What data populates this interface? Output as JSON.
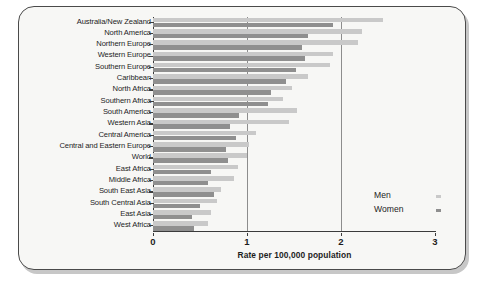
{
  "chart_data": {
    "type": "bar",
    "orientation": "horizontal",
    "title": "",
    "subtitle": "",
    "xlabel": "Rate per 100,000 population",
    "ylabel": "",
    "xlim": [
      0,
      3
    ],
    "xticks": [
      0,
      1,
      2,
      3
    ],
    "xtick_labels": [
      "0",
      "1",
      "2",
      "3"
    ],
    "grid": "vertical gridlines at x = 1 and x = 2",
    "legend_position": "inside lower right",
    "categories": [
      "Australia/New Zealand",
      "North America",
      "Northern Europe",
      "Western Europe",
      "Southern Europe",
      "Caribbean",
      "North Africa",
      "Southern Africa",
      "South America",
      "Western Asia",
      "Central America",
      "Central and Eastern Europe",
      "World",
      "East Africa",
      "Middle Africa",
      "South East Asia",
      "South Central Asia",
      "East Asia",
      "West Africa"
    ],
    "series": [
      {
        "name": "Men",
        "color": "#c9c9c9",
        "values": [
          2.45,
          2.22,
          2.18,
          1.92,
          1.88,
          1.65,
          1.48,
          1.38,
          1.53,
          1.45,
          1.1,
          1.02,
          1.0,
          0.9,
          0.86,
          0.72,
          0.68,
          0.62,
          0.58
        ]
      },
      {
        "name": "Women",
        "color": "#8f8f8f",
        "values": [
          1.92,
          1.65,
          1.58,
          1.62,
          1.52,
          1.42,
          1.25,
          1.22,
          0.92,
          0.82,
          0.88,
          0.78,
          0.8,
          0.62,
          0.58,
          0.65,
          0.5,
          0.42,
          0.44
        ]
      }
    ]
  },
  "legend": {
    "items": [
      {
        "label": "Men",
        "color": "#c9c9c9"
      },
      {
        "label": "Women",
        "color": "#8f8f8f"
      }
    ]
  },
  "axis": {
    "x_title": "Rate per 100,000 population",
    "tick_labels": [
      "0",
      "1",
      "2",
      "3"
    ]
  }
}
